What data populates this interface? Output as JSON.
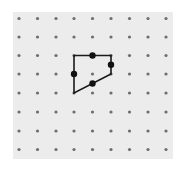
{
  "diagram": {
    "type": "dot-grid-polygon",
    "grid": {
      "columns": 9,
      "rows": 8,
      "x_positions": [
        19,
        37.5,
        56,
        74,
        92.5,
        111,
        129.5,
        148,
        166
      ],
      "y_positions": [
        18.5,
        37,
        55.5,
        74,
        93,
        112,
        131,
        149.5
      ],
      "dot_color": "#6e6e6e",
      "dot_radius": 1.6,
      "background": "#ececec"
    },
    "polygon": {
      "vertices_grid": [
        [
          3,
          2
        ],
        [
          5,
          2
        ],
        [
          5,
          3
        ],
        [
          3,
          4
        ]
      ],
      "stroke": "#1a1a1a",
      "stroke_width": 1.6
    },
    "highlighted_points": [
      {
        "label": "midpoint-top",
        "grid": [
          4,
          2
        ]
      },
      {
        "label": "midpoint-right",
        "grid": [
          5,
          2.5
        ]
      },
      {
        "label": "midpoint-left",
        "grid": [
          3,
          3
        ]
      },
      {
        "label": "midpoint-bottom",
        "grid": [
          4,
          3.5
        ]
      }
    ],
    "highlight_color": "#111111",
    "highlight_radius": 3.2
  }
}
